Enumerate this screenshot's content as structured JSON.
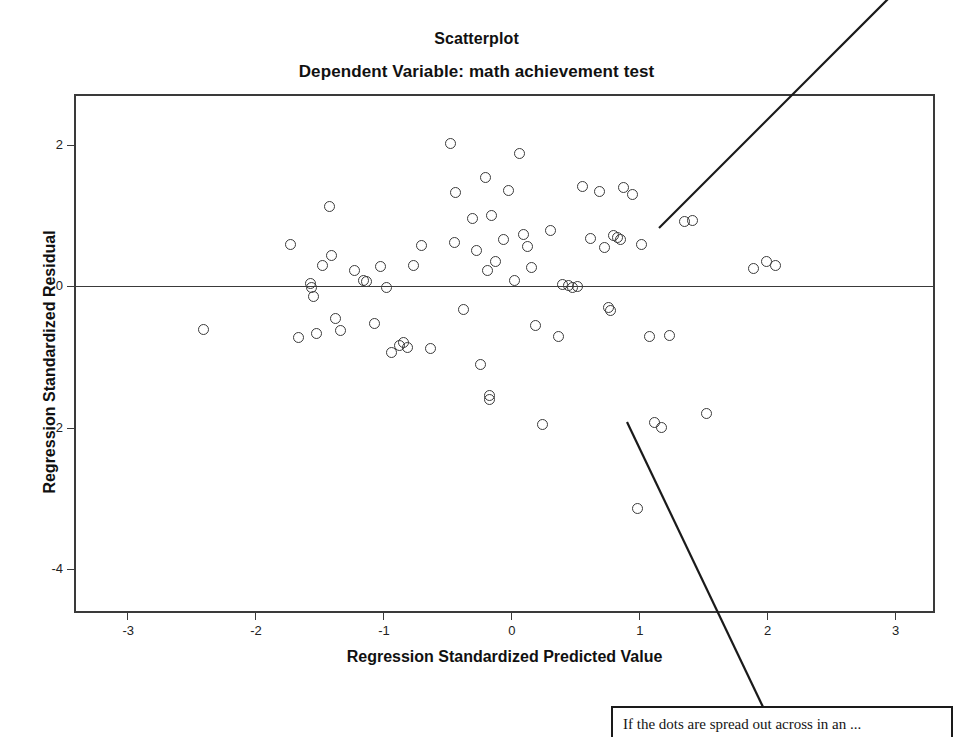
{
  "chart_data": {
    "type": "scatter",
    "title": "Scatterplot",
    "subtitle": "Dependent Variable: math achievement test",
    "xlabel": "Regression Standardized Predicted Value",
    "ylabel": "Regression Standardized Residual",
    "xlim": [
      -3.4,
      3.3
    ],
    "ylim": [
      -4.6,
      2.7
    ],
    "xticks": [
      -3,
      -2,
      -1,
      0,
      1,
      2,
      3
    ],
    "xtick_labels": [
      "-3",
      "-2",
      "-1",
      "0",
      "1",
      "2",
      "3"
    ],
    "yticks": [
      2,
      0,
      -2,
      -4
    ],
    "ytick_labels": [
      "2",
      "0",
      "-2",
      "-4"
    ],
    "grid": false,
    "legend": false,
    "marker": "open-circle",
    "marker_color": "#3b3b3b",
    "reference_lines": [
      {
        "orientation": "horizontal",
        "value": 0,
        "color": "#3a3a3a"
      }
    ],
    "points": [
      [
        -2.4,
        -0.61
      ],
      [
        -1.72,
        0.59
      ],
      [
        -1.66,
        -0.72
      ],
      [
        -1.57,
        0.04
      ],
      [
        -1.56,
        -0.02
      ],
      [
        -1.54,
        -0.14
      ],
      [
        -1.52,
        -0.66
      ],
      [
        -1.47,
        0.3
      ],
      [
        -1.42,
        1.14
      ],
      [
        -1.4,
        0.44
      ],
      [
        -1.37,
        -0.46
      ],
      [
        -1.33,
        -0.63
      ],
      [
        -1.22,
        0.22
      ],
      [
        -1.15,
        0.08
      ],
      [
        -1.13,
        0.07
      ],
      [
        -1.07,
        -0.53
      ],
      [
        -1.02,
        0.28
      ],
      [
        -0.97,
        -0.02
      ],
      [
        -0.93,
        -0.94
      ],
      [
        -0.87,
        -0.83
      ],
      [
        -0.84,
        -0.8
      ],
      [
        -0.81,
        -0.86
      ],
      [
        -0.76,
        0.3
      ],
      [
        -0.7,
        0.58
      ],
      [
        -0.63,
        -0.88
      ],
      [
        -0.47,
        2.03
      ],
      [
        -0.44,
        0.62
      ],
      [
        -0.43,
        1.33
      ],
      [
        -0.37,
        -0.33
      ],
      [
        -0.3,
        0.96
      ],
      [
        -0.27,
        0.51
      ],
      [
        -0.24,
        -1.1
      ],
      [
        -0.2,
        1.55
      ],
      [
        -0.18,
        0.22
      ],
      [
        -0.17,
        -1.55
      ],
      [
        -0.17,
        -1.6
      ],
      [
        -0.15,
        1.0
      ],
      [
        -0.12,
        0.35
      ],
      [
        -0.06,
        0.66
      ],
      [
        -0.02,
        1.36
      ],
      [
        0.03,
        0.09
      ],
      [
        0.07,
        1.88
      ],
      [
        0.1,
        0.74
      ],
      [
        0.13,
        0.56
      ],
      [
        0.16,
        0.27
      ],
      [
        0.19,
        -0.56
      ],
      [
        0.25,
        -1.95
      ],
      [
        0.31,
        0.8
      ],
      [
        0.37,
        -0.71
      ],
      [
        0.4,
        0.03
      ],
      [
        0.45,
        0.02
      ],
      [
        0.48,
        -0.02
      ],
      [
        0.52,
        0.0
      ],
      [
        0.56,
        1.42
      ],
      [
        0.62,
        0.68
      ],
      [
        0.69,
        1.35
      ],
      [
        0.73,
        0.55
      ],
      [
        0.76,
        -0.3
      ],
      [
        0.78,
        -0.34
      ],
      [
        0.8,
        0.72
      ],
      [
        0.83,
        0.7
      ],
      [
        0.86,
        0.66
      ],
      [
        0.88,
        1.41
      ],
      [
        0.95,
        1.31
      ],
      [
        0.99,
        -3.15
      ],
      [
        1.02,
        0.6
      ],
      [
        1.08,
        -0.71
      ],
      [
        1.12,
        -1.93
      ],
      [
        1.18,
        -2.0
      ],
      [
        1.24,
        -0.7
      ],
      [
        1.36,
        0.92
      ],
      [
        1.42,
        0.94
      ],
      [
        1.53,
        -1.8
      ],
      [
        1.9,
        0.25
      ],
      [
        2.0,
        0.35
      ],
      [
        2.07,
        0.3
      ]
    ]
  },
  "annotations": {
    "callout_text": "If the dots are spread out across in an ...",
    "leader_line_upper": {
      "from": [
        659,
        228
      ],
      "to": [
        953,
        -66
      ]
    },
    "leader_line_lower": {
      "from": [
        627,
        422
      ],
      "to": [
        763,
        707
      ]
    }
  }
}
